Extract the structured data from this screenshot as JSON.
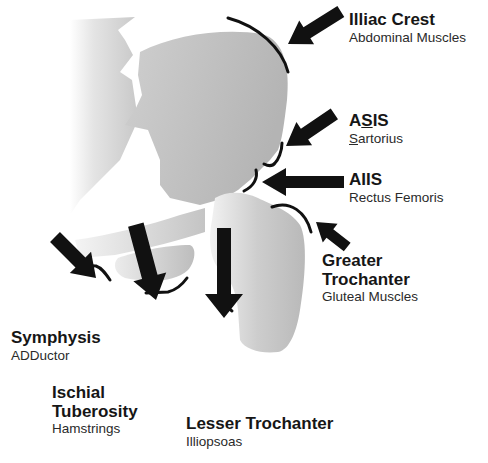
{
  "diagram": {
    "colors": {
      "bone_fill": "#b8b8b8",
      "bone_light": "#e6e6e6",
      "arrow": "#111111",
      "arc": "#111111",
      "text": "#1a1a1a"
    },
    "labels": [
      {
        "id": "illiac-crest",
        "title": "Illiac Crest",
        "muscle": "Abdominal Muscles"
      },
      {
        "id": "asis",
        "title_parts": [
          "A",
          "S",
          "IS"
        ],
        "title": "ASIS",
        "muscle_first": "S",
        "muscle_rest": "artorius",
        "muscle": "Sartorius"
      },
      {
        "id": "aiis",
        "title": "AIIS",
        "muscle": "Rectus Femoris"
      },
      {
        "id": "greater-trochanter",
        "title_line1": "Greater",
        "title_line2": "Trochanter",
        "title": "Greater Trochanter",
        "muscle": "Gluteal Muscles"
      },
      {
        "id": "symphysis",
        "title": "Symphysis",
        "muscle": "ADDuctor"
      },
      {
        "id": "ischial-tuberosity",
        "title_line1": "Ischial",
        "title_line2": "Tuberosity",
        "title": "Ischial Tuberosity",
        "muscle": "Hamstrings"
      },
      {
        "id": "lesser-trochanter",
        "title": "Lesser Trochanter",
        "muscle": "Illiopsoas"
      }
    ]
  }
}
